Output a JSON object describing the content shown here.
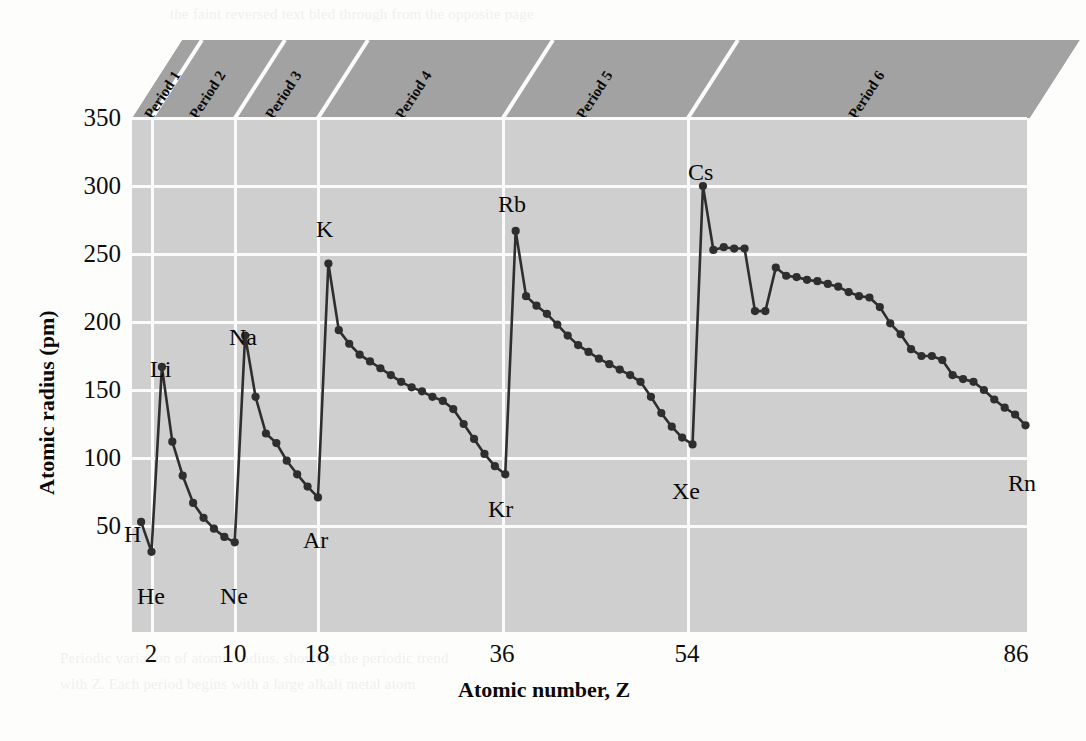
{
  "chart_data": {
    "type": "line",
    "title": "",
    "xlabel": "Atomic number, Z",
    "ylabel": "Atomic radius (pm)",
    "xlim": [
      0,
      88
    ],
    "ylim": [
      0,
      350
    ],
    "ytick_labels": [
      "350",
      "300",
      "250",
      "200",
      "150",
      "100",
      "50"
    ],
    "ytick_values": [
      350,
      300,
      250,
      200,
      150,
      100,
      50
    ],
    "xtick_labels": [
      "2",
      "10",
      "18",
      "36",
      "54",
      "86"
    ],
    "xtick_values": [
      2,
      10,
      18,
      36,
      54,
      86
    ],
    "grid": true,
    "legend": "none",
    "series": [
      {
        "name": "Atomic radius",
        "x": [
          1,
          2,
          3,
          4,
          5,
          6,
          7,
          8,
          9,
          10,
          11,
          12,
          13,
          14,
          15,
          16,
          17,
          18,
          19,
          20,
          21,
          22,
          23,
          24,
          25,
          26,
          27,
          28,
          29,
          30,
          31,
          32,
          33,
          34,
          35,
          36,
          37,
          38,
          39,
          40,
          41,
          42,
          43,
          44,
          45,
          46,
          47,
          48,
          49,
          50,
          51,
          52,
          53,
          54,
          55,
          56,
          57,
          58,
          59,
          60,
          61,
          62,
          63,
          64,
          65,
          66,
          67,
          68,
          69,
          70,
          71,
          72,
          73,
          74,
          75,
          76,
          77,
          78,
          79,
          80,
          81,
          82,
          83,
          84,
          85,
          86
        ],
        "values": [
          53,
          31,
          167,
          112,
          87,
          67,
          56,
          48,
          42,
          38,
          190,
          145,
          118,
          111,
          98,
          88,
          79,
          71,
          243,
          194,
          184,
          176,
          171,
          166,
          161,
          156,
          152,
          149,
          145,
          142,
          136,
          125,
          114,
          103,
          94,
          88,
          267,
          219,
          212,
          206,
          198,
          190,
          183,
          178,
          173,
          169,
          165,
          161,
          156,
          145,
          133,
          123,
          115,
          110,
          300,
          253,
          255,
          254,
          254,
          208,
          208,
          240,
          234,
          233,
          231,
          230,
          228,
          226,
          222,
          219,
          218,
          211,
          199,
          191,
          180,
          175,
          175,
          172,
          161,
          158,
          156,
          150,
          143,
          137,
          132,
          124
        ]
      }
    ],
    "annotations": [
      {
        "label": "H",
        "z": 1,
        "r": 53
      },
      {
        "label": "He",
        "z": 2,
        "r": 31
      },
      {
        "label": "Li",
        "z": 3,
        "r": 167
      },
      {
        "label": "Ne",
        "z": 10,
        "r": 38
      },
      {
        "label": "Na",
        "z": 11,
        "r": 190
      },
      {
        "label": "Ar",
        "z": 18,
        "r": 71
      },
      {
        "label": "K",
        "z": 19,
        "r": 243
      },
      {
        "label": "Kr",
        "z": 36,
        "r": 88
      },
      {
        "label": "Rb",
        "z": 37,
        "r": 267
      },
      {
        "label": "Xe",
        "z": 54,
        "r": 110
      },
      {
        "label": "Cs",
        "z": 55,
        "r": 300
      },
      {
        "label": "Rn",
        "z": 86,
        "r": 124
      }
    ],
    "bands": [
      {
        "label": "Period 1",
        "z_start": 1,
        "z_end": 2
      },
      {
        "label": "Period 2",
        "z_start": 3,
        "z_end": 10
      },
      {
        "label": "Period 3",
        "z_start": 11,
        "z_end": 18
      },
      {
        "label": "Period 4",
        "z_start": 19,
        "z_end": 36
      },
      {
        "label": "Period 5",
        "z_start": 37,
        "z_end": 54
      },
      {
        "label": "Period 6",
        "z_start": 55,
        "z_end": 86
      }
    ],
    "colors": {
      "plot_background": "#cfcfcf",
      "band_background": "#a2a2a2",
      "gridline": "#fbfbfb",
      "line": "#2e2e2e",
      "marker": "#2e2e2e",
      "text": "#0a0a0a"
    }
  },
  "bleed_text": {
    "top": "the faint reversed text bled through from the opposite page",
    "bottom_1": "Periodic variation of atomic radius, showing the periodic trend",
    "bottom_2": "with Z. Each period begins with a large alkali metal atom"
  }
}
